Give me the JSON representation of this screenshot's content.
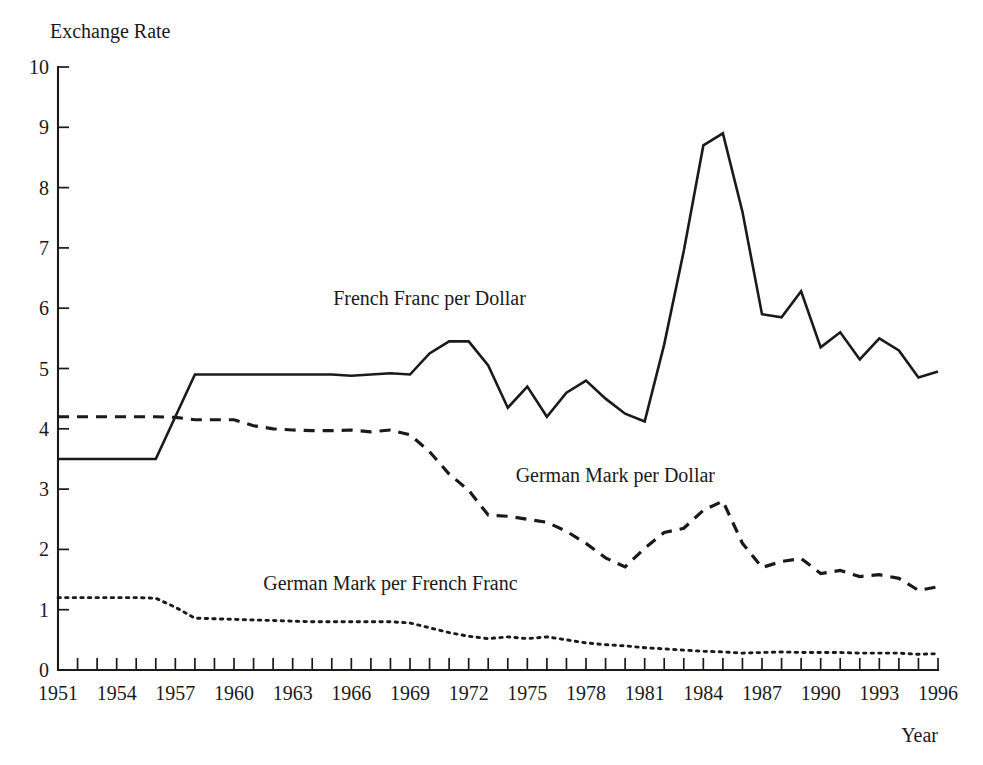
{
  "chart_data": {
    "type": "line",
    "title": "",
    "ylabel": "Exchange Rate",
    "xlabel": "Year",
    "xlim": [
      1951,
      1996
    ],
    "ylim": [
      0,
      10
    ],
    "grid": false,
    "legend_position": "inline-annotations",
    "y_ticks": [
      "0",
      "1",
      "2",
      "3",
      "4",
      "5",
      "6",
      "7",
      "8",
      "9",
      "10"
    ],
    "y_tick_values": [
      0,
      1,
      2,
      3,
      4,
      5,
      6,
      7,
      8,
      9,
      10
    ],
    "x_tick_values": [
      1951,
      1952,
      1953,
      1954,
      1955,
      1956,
      1957,
      1958,
      1959,
      1960,
      1961,
      1962,
      1963,
      1964,
      1965,
      1966,
      1967,
      1968,
      1969,
      1970,
      1971,
      1972,
      1973,
      1974,
      1975,
      1976,
      1977,
      1978,
      1979,
      1980,
      1981,
      1982,
      1983,
      1984,
      1985,
      1986,
      1987,
      1988,
      1989,
      1990,
      1991,
      1992,
      1993,
      1994,
      1995,
      1996
    ],
    "x_tick_labels": [
      "1951",
      "1954",
      "1957",
      "1960",
      "1963",
      "1966",
      "1969",
      "1972",
      "1975",
      "1978",
      "1981",
      "1984",
      "1987",
      "1990",
      "1993",
      "1996"
    ],
    "x_tick_label_values": [
      1951,
      1954,
      1957,
      1960,
      1963,
      1966,
      1969,
      1972,
      1975,
      1978,
      1981,
      1984,
      1987,
      1990,
      1993,
      1996
    ],
    "x": [
      1951,
      1952,
      1953,
      1954,
      1955,
      1956,
      1957,
      1958,
      1959,
      1960,
      1961,
      1962,
      1963,
      1964,
      1965,
      1966,
      1967,
      1968,
      1969,
      1970,
      1971,
      1972,
      1973,
      1974,
      1975,
      1976,
      1977,
      1978,
      1979,
      1980,
      1981,
      1982,
      1983,
      1984,
      1985,
      1986,
      1987,
      1988,
      1989,
      1990,
      1991,
      1992,
      1993,
      1994,
      1995,
      1996
    ],
    "series": [
      {
        "name": "French Franc per Dollar",
        "style": "solid",
        "color": "#1a1a1a",
        "label_x": 1970.0,
        "label_y": 6.05,
        "values": [
          3.5,
          3.5,
          3.5,
          3.5,
          3.5,
          3.5,
          4.2,
          4.9,
          4.9,
          4.9,
          4.9,
          4.9,
          4.9,
          4.9,
          4.9,
          4.88,
          4.9,
          4.92,
          4.9,
          5.25,
          5.45,
          5.45,
          5.05,
          4.35,
          4.7,
          4.2,
          4.6,
          4.8,
          4.5,
          4.25,
          4.12,
          5.4,
          6.95,
          8.7,
          8.9,
          7.6,
          5.9,
          5.85,
          6.28,
          5.35,
          5.6,
          5.15,
          5.5,
          5.3,
          4.85,
          4.95
        ]
      },
      {
        "name": "German Mark per Dollar",
        "style": "dashed",
        "color": "#1a1a1a",
        "label_x": 1979.5,
        "label_y": 3.12,
        "values": [
          4.2,
          4.2,
          4.2,
          4.2,
          4.2,
          4.2,
          4.19,
          4.15,
          4.15,
          4.15,
          4.05,
          4.0,
          3.98,
          3.97,
          3.97,
          3.98,
          3.95,
          3.98,
          3.9,
          3.62,
          3.25,
          2.98,
          2.57,
          2.55,
          2.5,
          2.45,
          2.3,
          2.1,
          1.86,
          1.71,
          2.02,
          2.28,
          2.35,
          2.65,
          2.8,
          2.1,
          1.7,
          1.8,
          1.85,
          1.6,
          1.65,
          1.55,
          1.58,
          1.52,
          1.32,
          1.38
        ]
      },
      {
        "name": "German Mark per French Franc",
        "style": "dotted",
        "color": "#1a1a1a",
        "label_x": 1968.0,
        "label_y": 1.32,
        "values": [
          1.2,
          1.2,
          1.2,
          1.2,
          1.2,
          1.19,
          1.04,
          0.86,
          0.85,
          0.84,
          0.83,
          0.82,
          0.81,
          0.8,
          0.8,
          0.8,
          0.8,
          0.8,
          0.78,
          0.7,
          0.62,
          0.56,
          0.52,
          0.55,
          0.52,
          0.55,
          0.5,
          0.45,
          0.42,
          0.4,
          0.37,
          0.35,
          0.33,
          0.31,
          0.3,
          0.28,
          0.29,
          0.3,
          0.29,
          0.29,
          0.29,
          0.28,
          0.28,
          0.28,
          0.26,
          0.27
        ]
      }
    ]
  }
}
